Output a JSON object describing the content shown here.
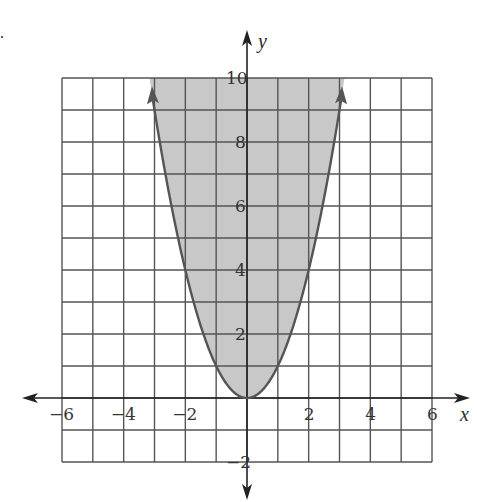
{
  "figure": {
    "label": "."
  },
  "chart_data": {
    "type": "area",
    "title": "",
    "equation": "y = x^2",
    "inequality": "y >= x^2",
    "xlabel": "x",
    "ylabel": "y",
    "xlim": [
      -6,
      6
    ],
    "ylim": [
      -2,
      10
    ],
    "grid": true,
    "grid_step": 1,
    "x_ticks": [
      -6,
      -4,
      -2,
      2,
      4,
      6
    ],
    "y_ticks": [
      -2,
      2,
      4,
      6,
      8,
      10
    ],
    "x_tick_labels": [
      "−6",
      "−4",
      "−2",
      "2",
      "4",
      "6"
    ],
    "y_tick_labels": [
      "−2",
      "2",
      "4",
      "6",
      "8",
      "10"
    ],
    "curve_points": {
      "x": [
        -3.16,
        -3,
        -2,
        -1,
        0,
        1,
        2,
        3,
        3.16
      ],
      "y": [
        10,
        9,
        4,
        1,
        0,
        1,
        4,
        9,
        10
      ]
    },
    "shaded_region": "above curve",
    "colors": {
      "shade": "#c8c8c8",
      "curve": "#555555",
      "grid": "#555555",
      "axes": "#222222"
    }
  }
}
